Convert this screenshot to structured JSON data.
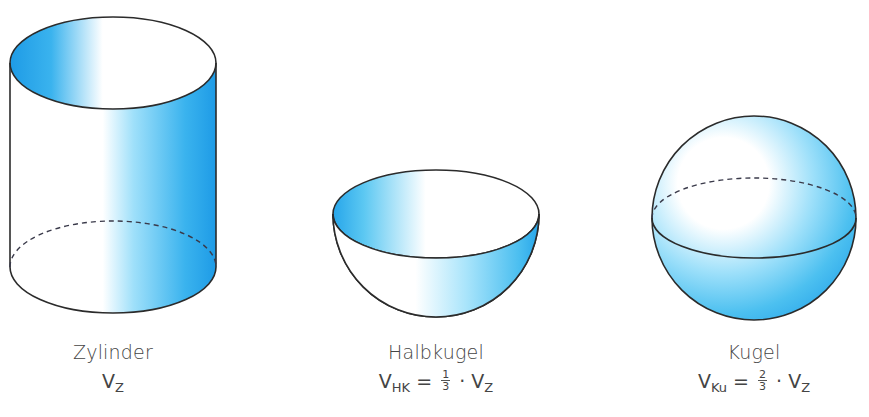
{
  "colors": {
    "blue_dark": "#1e9be6",
    "blue_mid": "#5cc8f2",
    "blue_light": "#bdeafc",
    "outline": "#2b2b2b",
    "text": "#444444"
  },
  "figures": [
    {
      "id": "zylinder",
      "name": "Zylinder",
      "formula": {
        "var": "V",
        "sub": "Z",
        "rhs": ""
      }
    },
    {
      "id": "halbkugel",
      "name": "Halbkugel",
      "formula": {
        "var": "V",
        "sub": "HK",
        "eq": "=",
        "frac_num": "1",
        "frac_den": "3",
        "dot": "·",
        "rhs_var": "V",
        "rhs_sub": "Z"
      }
    },
    {
      "id": "kugel",
      "name": "Kugel",
      "formula": {
        "var": "V",
        "sub": "Ku",
        "eq": "=",
        "frac_num": "2",
        "frac_den": "3",
        "dot": "·",
        "rhs_var": "V",
        "rhs_sub": "Z"
      }
    }
  ]
}
